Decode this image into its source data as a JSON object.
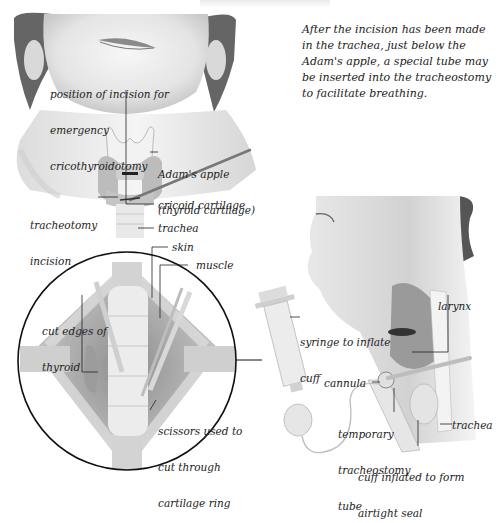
{
  "caption": {
    "lines": [
      "After the incision has been made",
      "in the trachea, just below the",
      "Adam's apple, a special tube may",
      "be inserted into the tracheostomy",
      "to facilitate breathing."
    ]
  },
  "front_view": {
    "labels": {
      "incision_position": [
        "position of incision for",
        "emergency",
        "cricothyroidotomy"
      ],
      "adams_apple": [
        "Adam's apple",
        "(thyroid cartilage)"
      ],
      "tracheotomy_incision": [
        "tracheotomy",
        "incision"
      ],
      "cricoid": "cricoid cartilage",
      "trachea": "trachea"
    }
  },
  "magnified_view": {
    "labels": {
      "skin": "skin",
      "muscle": "muscle",
      "cut_edges": [
        "cut edges of",
        "thyroid"
      ],
      "scissors": [
        "scissors used to",
        "cut through",
        "cartilage ring"
      ]
    }
  },
  "side_view": {
    "labels": {
      "syringe": [
        "syringe to inflate",
        "cuff"
      ],
      "larynx": "larynx",
      "cannula": "cannula",
      "temp_tube": [
        "temporary",
        "tracheostomy",
        "tube"
      ],
      "trachea": "trachea",
      "cuff": [
        "cuff inflated to form",
        "airtight seal"
      ]
    }
  },
  "colors": {
    "line": "#222222",
    "skin_light": "#f1f1f1",
    "skin_mid": "#cfcfcf",
    "hair": "#3a3a3a",
    "tissue": "#bdbdbd"
  }
}
